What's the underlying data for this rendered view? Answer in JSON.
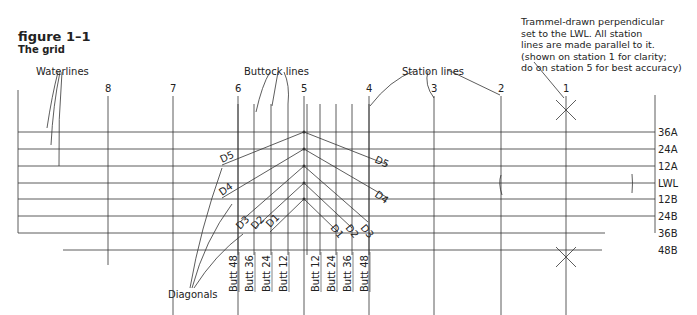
{
  "figure": {
    "number": "figure 1–1",
    "title": "The grid"
  },
  "callouts": {
    "waterlines": "Waterlines",
    "buttock_lines": "Buttock lines",
    "station_lines": "Station lines",
    "diagonals": "Diagonals",
    "trammel_note": "Trammel-drawn perpendicular\nset to the LWL. All station\nlines are made parallel to it.\n(shown on station 1 for clarity;\ndo on station 5 for best accuracy)"
  },
  "stations": [
    {
      "label": "8",
      "x": 108
    },
    {
      "label": "7",
      "x": 173
    },
    {
      "label": "6",
      "x": 238
    },
    {
      "label": "5",
      "x": 304
    },
    {
      "label": "4",
      "x": 369
    },
    {
      "label": "3",
      "x": 434
    },
    {
      "label": "2",
      "x": 501
    },
    {
      "label": "1",
      "x": 566
    }
  ],
  "waterlines": [
    {
      "label": "36A",
      "y": 132
    },
    {
      "label": "24A",
      "y": 149
    },
    {
      "label": "12A",
      "y": 166
    },
    {
      "label": "LWL",
      "y": 183
    },
    {
      "label": "12B",
      "y": 199
    },
    {
      "label": "24B",
      "y": 216
    },
    {
      "label": "36B",
      "y": 233
    },
    {
      "label": "48B",
      "y": 250
    }
  ],
  "buttocks": [
    {
      "label": "Butt 48",
      "x": 238
    },
    {
      "label": "Butt 36",
      "x": 254
    },
    {
      "label": "Butt 24",
      "x": 271
    },
    {
      "label": "Butt 12",
      "x": 288
    },
    {
      "label": "Butt 12",
      "x": 320
    },
    {
      "label": "Butt 24",
      "x": 336
    },
    {
      "label": "Butt 36",
      "x": 352
    },
    {
      "label": "Butt 48",
      "x": 369
    }
  ],
  "diagonals": [
    "D1",
    "D2",
    "D3",
    "D4",
    "D5"
  ]
}
